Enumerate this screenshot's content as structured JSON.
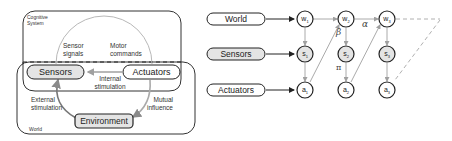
{
  "left_diagram": {
    "cognitive_system_label_line1": "Cognitive",
    "cognitive_system_label_line2": "System",
    "world_label": "World",
    "sensors": "Sensors",
    "actuators": "Actuators",
    "environment": "Environment",
    "sensor_signals_line1": "Sensor",
    "sensor_signals_line2": "signals",
    "motor_commands_line1": "Motor",
    "motor_commands_line2": "commands",
    "internal_stimulation_line1": "Internal",
    "internal_stimulation_line2": "stimulation",
    "external_stimulation_line1": "External",
    "external_stimulation_line2": "stimulation",
    "mutual_influence_line1": "Mutual",
    "mutual_influence_line2": "influence"
  },
  "right_diagram": {
    "rows": [
      {
        "label": "World",
        "nodes": [
          "w",
          "w",
          "w"
        ]
      },
      {
        "label": "Sensors",
        "nodes": [
          "s",
          "s",
          "s"
        ]
      },
      {
        "label": "Actuators",
        "nodes": [
          "a",
          "a",
          "a"
        ]
      }
    ],
    "subscripts": [
      "1",
      "2",
      "3"
    ],
    "greek": {
      "alpha": "α",
      "beta": "β",
      "pi": "π"
    }
  },
  "colors": {
    "line": "#222222",
    "arrow_gray": "#9a9a9a",
    "box_fill": "#e6e6e6",
    "dashed_gray": "#b0b0b0"
  }
}
